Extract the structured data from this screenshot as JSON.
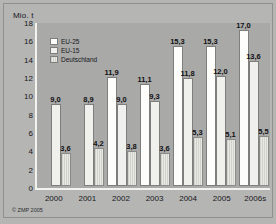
{
  "chart_data": {
    "type": "bar",
    "title": "",
    "xlabel": "",
    "ylabel": "Mio. t",
    "ylim": [
      0,
      18
    ],
    "yticks": [
      18,
      16,
      14,
      12,
      10,
      8,
      6,
      4,
      2,
      0
    ],
    "grid": false,
    "legend_position": "top-left",
    "categories": [
      "2000",
      "2001",
      "2002",
      "2003",
      "2004",
      "2005",
      "2006s"
    ],
    "series": [
      {
        "name": "EU-25",
        "values": [
          null,
          null,
          11.9,
          11.1,
          15.3,
          15.3,
          17.0
        ],
        "labels": [
          "",
          "",
          "11,9",
          "11,1",
          "15,3",
          "15,3",
          "17,0"
        ]
      },
      {
        "name": "EU-15",
        "values": [
          9.0,
          8.9,
          9.0,
          9.3,
          11.8,
          12.0,
          13.6
        ],
        "labels": [
          "9,0",
          "8,9",
          "9,0",
          "9,3",
          "11,8",
          "12,0",
          "13,6"
        ]
      },
      {
        "name": "Deutschland",
        "values": [
          3.6,
          4.2,
          3.8,
          3.6,
          5.3,
          5.1,
          5.5
        ],
        "labels": [
          "3,6",
          "4,2",
          "3,8",
          "3,6",
          "5,3",
          "5,1",
          "5,5"
        ]
      }
    ],
    "source": "© ZMP 2005"
  },
  "colors": {
    "background": "#b5b5b4",
    "plot_background": "#a9a9a8",
    "axis": "#f2f2ee",
    "eu25": "#fdfdfb",
    "eu15": "#f0f0ec",
    "deutschland": "#dcdcd6",
    "text": "#17171a"
  }
}
